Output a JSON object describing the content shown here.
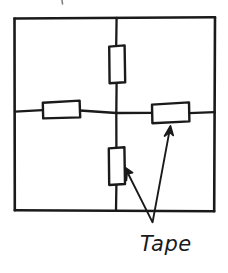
{
  "figure": {
    "background_color": "#ffffff",
    "ink_color": "#1a1a1a"
  },
  "frame": {
    "name": "outer-rectangle",
    "left": 14,
    "top": 17,
    "right": 215,
    "bottom": 211
  },
  "grid": {
    "vertical_line_x": 116,
    "horizontal_line_y": 113,
    "intersection": {
      "x": 116,
      "y": 113
    }
  },
  "tape_strips": [
    {
      "id": "tape-top",
      "orientation": "vertical",
      "x": 109,
      "y": 45,
      "width": 16,
      "height": 38
    },
    {
      "id": "tape-left",
      "orientation": "horizontal",
      "x": 42,
      "y": 100,
      "width": 38,
      "height": 18
    },
    {
      "id": "tape-right",
      "orientation": "horizontal",
      "x": 151,
      "y": 102,
      "width": 38,
      "height": 21
    },
    {
      "id": "tape-bottom",
      "orientation": "vertical",
      "x": 109,
      "y": 147,
      "width": 16,
      "height": 38
    }
  ],
  "annotation": {
    "label": "Tape",
    "label_x": 140,
    "label_y": 250,
    "vertex": {
      "x": 152,
      "y": 222
    },
    "arrows": [
      {
        "id": "arrow-to-bottom-tape",
        "from": {
          "x": 152,
          "y": 222
        },
        "to": {
          "x": 124,
          "y": 168
        },
        "points_at": "tape-bottom"
      },
      {
        "id": "arrow-to-right-tape",
        "from": {
          "x": 152,
          "y": 222
        },
        "to": {
          "x": 170,
          "y": 126
        },
        "points_at": "tape-right"
      }
    ]
  }
}
